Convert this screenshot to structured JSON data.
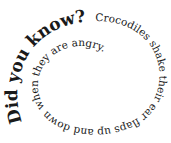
{
  "graphic": {
    "type": "spiral-text",
    "full_text": "Did you know? Crocodiles shake their ear flaps up and down when they are angry.",
    "segments": {
      "heading": "Did you know?",
      "body": "Crocodiles shake their ear flaps up and down when they are angry."
    },
    "text_color": "#1a1a1a",
    "background": "#ffffff"
  }
}
